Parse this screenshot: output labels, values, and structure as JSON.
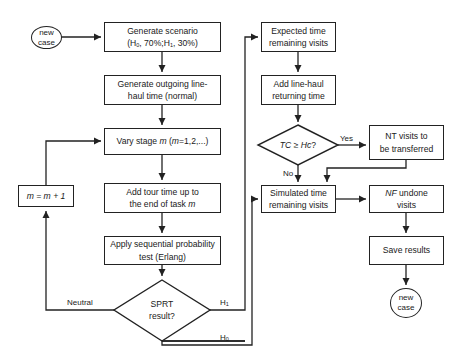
{
  "diagram": {
    "type": "flowchart",
    "nodes": {
      "start": {
        "line1": "new",
        "line2": "case",
        "shape": "ellipse"
      },
      "generate_scenario": {
        "line1": "Generate scenario",
        "line2_pre": "(H",
        "sub0": "0",
        "line2_mid": ", 70%;H",
        "sub1": "1",
        "line2_post": ", 30%)"
      },
      "generate_outgoing": {
        "line1": "Generate outgoing line-",
        "line2": "haul time (normal)"
      },
      "vary_stage": {
        "pre": "Vary stage ",
        "m1": "m",
        "mid": " (",
        "m2": "m",
        "post": "=1,2,...)"
      },
      "add_tour_time": {
        "line1": "Add tour time up to",
        "line2_pre": "the end of task ",
        "m": "m"
      },
      "apply_sprt": {
        "line1": "Apply sequential probability",
        "line2": "test (Erlang)"
      },
      "sprt_decision": {
        "line1": "SPRT",
        "line2": "result?",
        "shape": "diamond"
      },
      "increment_m": {
        "text": "m = m + 1"
      },
      "expected_time": {
        "line1": "Expected time",
        "line2": "remaining visits"
      },
      "add_line_haul": {
        "line1": "Add line-haul",
        "line2": "returning time"
      },
      "tc_decision": {
        "it1": "TC",
        "mid": " ≥ ",
        "it2": "Hc",
        "post": "?",
        "shape": "diamond"
      },
      "nt_visits": {
        "line1": "NT visits to",
        "line2": "be transferred"
      },
      "simulated_time": {
        "line1": "Simulated time",
        "line2": "remaining visits"
      },
      "nf_undone": {
        "it": "NF",
        "line1_post": " undone",
        "line2": "visits"
      },
      "save_results": {
        "text": "Save results"
      },
      "end": {
        "line1": "new",
        "line2": "case",
        "shape": "ellipse"
      }
    },
    "edge_labels": {
      "neutral": "Neutral",
      "h1": "H",
      "h1_sub": "1",
      "h0": "H",
      "h0_sub": "0",
      "yes": "Yes",
      "no": "No"
    },
    "colors": {
      "stroke": "#222222",
      "fill": "#ffffff",
      "text": "#1a1a1a"
    }
  }
}
